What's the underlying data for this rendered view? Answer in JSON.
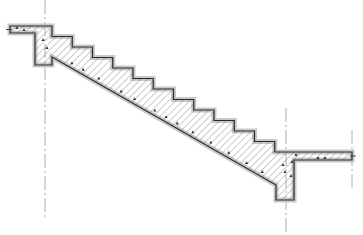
{
  "drawing": {
    "title": "Staircase section",
    "description": "Cross-section of a reinforced concrete straight-flight stair with landing beams at top and bottom",
    "colors": {
      "background": "#ffffff",
      "outline": "#2a2a2a",
      "hatch": "#6a6a6a",
      "halo": "#c8c8c8",
      "centerline": "#9a9a9a",
      "aggregate": "#333333"
    },
    "flight": {
      "step_count": 12,
      "start": [
        52,
        26
      ],
      "tread_px": 20.25,
      "riser_px": 10.5
    },
    "top_landing": {
      "slab": {
        "x1": 10,
        "x2": 52,
        "y_top": 26,
        "y_bottom": 33
      },
      "beam": {
        "x1": 35,
        "x2": 52,
        "y_bottom": 65
      }
    },
    "bottom_landing": {
      "slab": {
        "x1": 275,
        "x2": 352,
        "y_top": 152,
        "y_bottom": 160
      },
      "beam": {
        "x1": 276,
        "x2": 294,
        "y_bottom": 200
      }
    },
    "soffit": {
      "from": [
        52,
        57
      ],
      "to": [
        276,
        185
      ]
    },
    "centerlines": [
      {
        "x": 45,
        "y1": 0,
        "y2": 218
      },
      {
        "x": 286,
        "y1": 108,
        "y2": 235
      },
      {
        "x": 352,
        "y1": 130,
        "y2": 190
      }
    ]
  }
}
